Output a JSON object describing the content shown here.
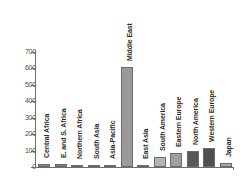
{
  "chart_data": {
    "type": "bar",
    "title": "",
    "xlabel": "",
    "ylabel": "",
    "ylim": [
      0,
      700
    ],
    "yticks": [
      0,
      100,
      200,
      300,
      400,
      500,
      600,
      700
    ],
    "ytick_labels": [
      "0",
      "100",
      "200",
      "300",
      "400",
      "500",
      "600",
      "700"
    ],
    "grid": false,
    "legend": "none",
    "categories": [
      "Central Africa",
      "E. and S. Africa",
      "Northern Africa",
      "South Asia",
      "Asia-Pacific",
      "Middle East",
      "East Asia",
      "South America",
      "Eastern Europe",
      "North America",
      "Western Europe",
      "Japan"
    ],
    "values": [
      18,
      18,
      15,
      8,
      15,
      610,
      10,
      60,
      85,
      100,
      115,
      22
    ],
    "bar_colors": [
      "#8a8a8a",
      "#7d7d7d",
      "#b0b0b0",
      "#c9c9c9",
      "#bdbdbd",
      "#9a9a9a",
      "#bdbdbd",
      "#b4b4b4",
      "#a0a0a0",
      "#585858",
      "#4f4f4f",
      "#a8a8a8"
    ]
  },
  "axis": {
    "line_color": "#6e6e6e",
    "tick_label_color": "#4a4a4a"
  },
  "labels": {
    "label_color": "#2b2b2b"
  }
}
